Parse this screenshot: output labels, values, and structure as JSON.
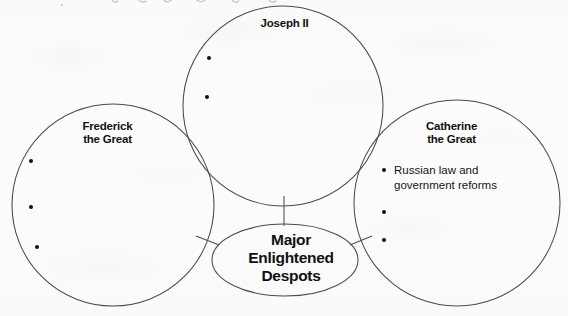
{
  "document": {
    "type": "graphic-organizer-worksheet",
    "title": "Major Enlightened Despots",
    "ink_color": "#111111",
    "paper_color": "#fbfbfb",
    "line_color": "#4a4a50"
  },
  "center_node": {
    "label": "Major\nEnlightened\nDespots",
    "shape": "ellipse"
  },
  "circles": [
    {
      "id": "joseph",
      "label": "Joseph II",
      "shape": "circle",
      "entries": [
        "",
        ""
      ],
      "filled_count": 0
    },
    {
      "id": "frederick",
      "label": "Frederick\nthe Great",
      "shape": "circle",
      "entries": [
        "",
        "",
        ""
      ],
      "filled_count": 0
    },
    {
      "id": "catherine",
      "label": "Catherine\nthe Great",
      "shape": "circle",
      "entries": [
        "Russian law and government reforms",
        "",
        ""
      ],
      "filled_count": 1
    }
  ],
  "connectors": [
    {
      "from": "joseph",
      "to": "center_node"
    },
    {
      "from": "frederick",
      "to": "center_node"
    },
    {
      "from": "catherine",
      "to": "center_node"
    }
  ],
  "annotations": {
    "top_margin_handwriting": "(faint cursive handwriting, cropped at top edge — illegible)"
  }
}
